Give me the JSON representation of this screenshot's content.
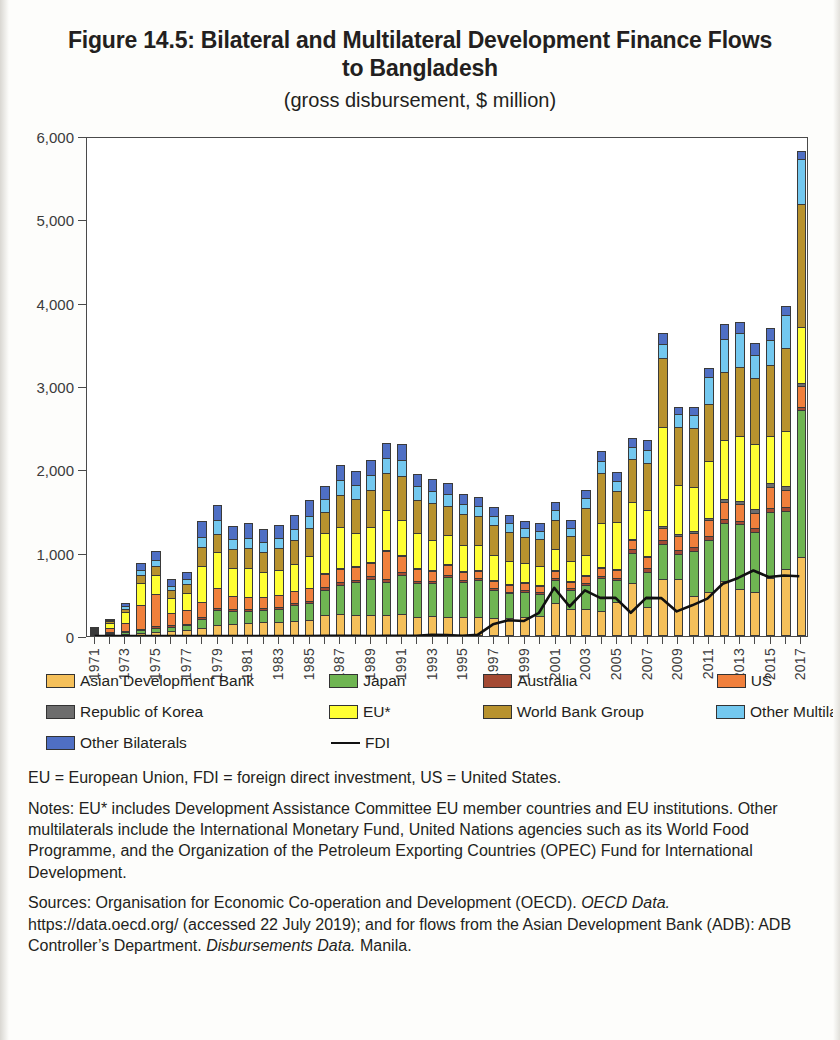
{
  "figure": {
    "title": "Figure 14.5: Bilateral and Multilateral Development Finance Flows to Bangladesh",
    "subtitle": "(gross disbursement, $ million)"
  },
  "notes": {
    "abbreviations": "EU = European Union, FDI = foreign direct investment, US = United States.",
    "notes_text": "Notes: EU* includes Development Assistance Committee EU member countries and EU institutions. Other multilaterals include the International Monetary Fund, United Nations agencies such as its World Food Programme, and the Organization of the Petroleum Exporting Countries (OPEC) Fund for International Development.",
    "sources_lead": "Sources: Organisation for Economic Co-operation and Development (OECD). ",
    "sources_italic1": "OECD Data.",
    "sources_mid": " https://data.oecd.org/ (accessed 22 July 2019); and for flows from the Asian Development Bank (ADB): ADB Controller’s Department. ",
    "sources_italic2": "Disbursements Data.",
    "sources_tail": " Manila."
  },
  "legend": {
    "rows": [
      [
        {
          "label": "Asian Development Bank",
          "color": "#f5c05a",
          "type": "swatch",
          "width": 285
        },
        {
          "label": "Japan",
          "color": "#6fb552",
          "type": "swatch",
          "width": 155
        },
        {
          "label": "Australia",
          "color": "#a44a33",
          "type": "swatch",
          "width": 235
        },
        {
          "label": "US",
          "color": "#f0803c",
          "type": "swatch",
          "width": 100
        }
      ],
      [
        {
          "label": "Republic of Korea",
          "color": "#6d6d6d",
          "type": "swatch",
          "width": 285
        },
        {
          "label": "EU*",
          "color": "#ffff33",
          "type": "swatch",
          "width": 155
        },
        {
          "label": "World Bank Group",
          "color": "#b8922e",
          "type": "swatch",
          "width": 235
        },
        {
          "label": "Other Multilaterals",
          "color": "#73c8ef",
          "type": "swatch",
          "width": 100
        }
      ],
      [
        {
          "label": "Other Bilaterals",
          "color": "#4f6fc4",
          "type": "swatch",
          "width": 285
        },
        {
          "label": "FDI",
          "color": "#111111",
          "type": "line",
          "width": 155
        }
      ]
    ]
  },
  "chart_data": {
    "type": "bar",
    "stacked": true,
    "title": "Figure 14.5: Bilateral and Multilateral Development Finance Flows to Bangladesh",
    "subtitle": "(gross disbursement, $ million)",
    "xlabel": "",
    "ylabel": "",
    "ylim": [
      0,
      6000
    ],
    "ytick_labels": [
      "0",
      "1,000",
      "2,000",
      "3,000",
      "4,000",
      "5,000",
      "6,000"
    ],
    "ytick_values": [
      0,
      1000,
      2000,
      3000,
      4000,
      5000,
      6000
    ],
    "grid": false,
    "legend_position": "below",
    "categories": [
      "1971",
      "1972",
      "1973",
      "1974",
      "1975",
      "1976",
      "1977",
      "1978",
      "1979",
      "1980",
      "1981",
      "1982",
      "1983",
      "1984",
      "1985",
      "1986",
      "1987",
      "1988",
      "1989",
      "1990",
      "1991",
      "1992",
      "1993",
      "1994",
      "1995",
      "1996",
      "1997",
      "1998",
      "1999",
      "2000",
      "2001",
      "2002",
      "2003",
      "2004",
      "2005",
      "2006",
      "2007",
      "2008",
      "2009",
      "2010",
      "2011",
      "2012",
      "2013",
      "2014",
      "2015",
      "2016",
      "2017"
    ],
    "xtick_labels": [
      "1971",
      "1973",
      "1975",
      "1977",
      "1979",
      "1981",
      "1983",
      "1985",
      "1987",
      "1989",
      "1991",
      "1993",
      "1995",
      "1997",
      "1999",
      "2001",
      "2003",
      "2005",
      "2007",
      "2009",
      "2011",
      "2013",
      "2015",
      "2017"
    ],
    "series": [
      {
        "name": "Asian Development Bank",
        "color": "#f5c05a",
        "values": [
          5,
          10,
          20,
          35,
          55,
          60,
          70,
          95,
          130,
          150,
          160,
          165,
          170,
          185,
          195,
          250,
          265,
          250,
          250,
          255,
          270,
          235,
          245,
          225,
          230,
          225,
          215,
          215,
          225,
          240,
          400,
          330,
          330,
          300,
          410,
          640,
          345,
          690,
          690,
          480,
          530,
          660,
          560,
          530,
          700,
          800,
          950
        ]
      },
      {
        "name": "Japan",
        "color": "#6fb552",
        "values": [
          5,
          10,
          20,
          40,
          45,
          55,
          60,
          110,
          185,
          150,
          140,
          150,
          160,
          190,
          205,
          310,
          355,
          400,
          440,
          400,
          470,
          400,
          390,
          490,
          420,
          450,
          340,
          300,
          310,
          270,
          280,
          230,
          290,
          400,
          260,
          360,
          430,
          420,
          300,
          540,
          620,
          700,
          780,
          720,
          790,
          700,
          1760
        ]
      },
      {
        "name": "Australia",
        "color": "#a44a33",
        "values": [
          2,
          4,
          8,
          15,
          18,
          14,
          16,
          20,
          25,
          22,
          22,
          20,
          22,
          24,
          26,
          28,
          30,
          32,
          30,
          28,
          30,
          28,
          25,
          26,
          24,
          24,
          22,
          22,
          24,
          22,
          24,
          22,
          24,
          26,
          28,
          40,
          45,
          40,
          45,
          45,
          50,
          48,
          45,
          48,
          50,
          48,
          40
        ]
      },
      {
        "name": "US",
        "color": "#f0803c",
        "values": [
          15,
          60,
          110,
          280,
          390,
          150,
          170,
          190,
          240,
          160,
          150,
          140,
          140,
          145,
          150,
          160,
          155,
          150,
          165,
          340,
          190,
          150,
          120,
          110,
          100,
          90,
          85,
          80,
          75,
          70,
          80,
          75,
          80,
          90,
          95,
          110,
          130,
          150,
          170,
          175,
          195,
          200,
          195,
          185,
          250,
          200,
          250
        ]
      },
      {
        "name": "Republic of Korea",
        "color": "#6d6d6d",
        "values": [
          0,
          0,
          0,
          0,
          0,
          0,
          0,
          0,
          0,
          0,
          0,
          0,
          0,
          0,
          0,
          2,
          2,
          3,
          3,
          3,
          4,
          4,
          5,
          5,
          6,
          6,
          6,
          6,
          7,
          7,
          8,
          8,
          9,
          10,
          12,
          14,
          16,
          18,
          20,
          22,
          28,
          34,
          40,
          45,
          52,
          58,
          40
        ]
      },
      {
        "name": "EU*",
        "color": "#ffff33",
        "values": [
          18,
          70,
          130,
          270,
          220,
          180,
          200,
          430,
          430,
          330,
          340,
          290,
          300,
          320,
          390,
          480,
          500,
          400,
          420,
          480,
          430,
          420,
          370,
          350,
          310,
          300,
          300,
          270,
          240,
          230,
          250,
          230,
          240,
          530,
          560,
          450,
          550,
          1190,
          590,
          530,
          680,
          710,
          780,
          780,
          560,
          660,
          670
        ]
      },
      {
        "name": "World Bank Group",
        "color": "#b8922e",
        "values": [
          5,
          20,
          40,
          90,
          110,
          90,
          110,
          230,
          220,
          230,
          240,
          250,
          260,
          290,
          330,
          260,
          390,
          410,
          440,
          450,
          520,
          400,
          440,
          360,
          370,
          340,
          360,
          350,
          310,
          320,
          350,
          300,
          560,
          600,
          380,
          510,
          560,
          830,
          700,
          700,
          680,
          820,
          830,
          790,
          850,
          990,
          1480
        ]
      },
      {
        "name": "Other Multilaterals",
        "color": "#73c8ef",
        "values": [
          5,
          15,
          30,
          60,
          70,
          55,
          60,
          110,
          160,
          120,
          130,
          120,
          125,
          130,
          150,
          150,
          180,
          170,
          180,
          180,
          200,
          160,
          150,
          140,
          130,
          120,
          115,
          110,
          100,
          105,
          115,
          100,
          120,
          150,
          115,
          140,
          160,
          170,
          150,
          160,
          330,
          390,
          410,
          280,
          300,
          400,
          530
        ]
      },
      {
        "name": "Other Bilaterals",
        "color": "#4f6fc4",
        "values": [
          5,
          20,
          40,
          90,
          110,
          80,
          85,
          200,
          180,
          160,
          170,
          150,
          160,
          170,
          190,
          160,
          175,
          170,
          180,
          180,
          190,
          150,
          140,
          130,
          120,
          110,
          105,
          100,
          95,
          95,
          105,
          95,
          105,
          120,
          105,
          110,
          120,
          130,
          90,
          100,
          110,
          180,
          125,
          140,
          140,
          110,
          100
        ]
      }
    ],
    "line_series": {
      "name": "FDI",
      "color": "#111111",
      "values": [
        0,
        0,
        0,
        0,
        0,
        0,
        0,
        0,
        0,
        0,
        0,
        0,
        0,
        0,
        0,
        2,
        3,
        2,
        0,
        3,
        2,
        4,
        14,
        11,
        2,
        14,
        140,
        190,
        180,
        280,
        580,
        355,
        550,
        460,
        460,
        280,
        460,
        456,
        296,
        370,
        450,
        630,
        700,
        790,
        710,
        730,
        720
      ],
      "note": "FDI plotted as $ million on same axis"
    }
  }
}
